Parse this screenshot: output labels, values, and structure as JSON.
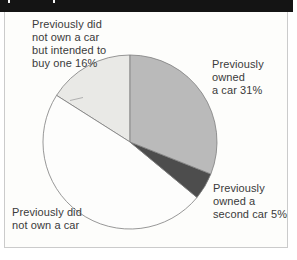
{
  "header": {
    "bar_color": "#141414"
  },
  "chart_data": {
    "type": "pie",
    "start_angle_deg": 0,
    "direction": "clockwise",
    "outline_color": "#7d7d7d",
    "segments": [
      {
        "label": "Previously owned a car",
        "value": 31,
        "color": "#bababa"
      },
      {
        "label": "Previously owned a second car",
        "value": 5,
        "color": "#4d4d4d"
      },
      {
        "label": "Previously did not own a car",
        "value": 48,
        "color": "#fdfdfc"
      },
      {
        "label": "Previously did not own a car but intended to buy one",
        "value": 16,
        "color": "#e9e9e6"
      }
    ],
    "geometry": {
      "cx": 130,
      "cy": 142,
      "r": 87
    }
  },
  "labels": {
    "intended": "Previously did\nnot own a car\nbut intended to\nbuy one  16%",
    "owned_car": "Previously\nowned\na car  31%",
    "second_car": "Previously\nowned a\nsecond car  5%",
    "not_own": "Previously did\nnot own a car"
  }
}
